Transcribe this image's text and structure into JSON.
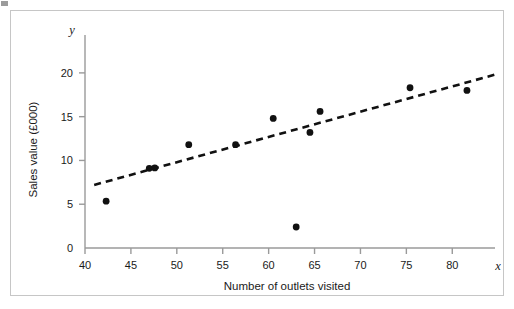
{
  "figure": {
    "caption_fragment": "",
    "border_color": "#c6c6c6",
    "background": "#ffffff"
  },
  "chart_data": {
    "type": "scatter",
    "title": "",
    "subtitle": "",
    "xlabel": "Number of outlets visited",
    "ylabel": "Sales value (£000)",
    "x_axis_letter": "x",
    "y_axis_letter": "y",
    "xlim": [
      40,
      84
    ],
    "ylim": [
      0,
      22.5
    ],
    "xticks": [
      40,
      45,
      50,
      55,
      60,
      65,
      70,
      75,
      80
    ],
    "xtick_labels": [
      "40",
      "45",
      "50",
      "55",
      "60",
      "65",
      "70",
      "75",
      "80"
    ],
    "yticks": [
      0,
      5,
      10,
      15,
      20
    ],
    "ytick_labels": [
      "0",
      "5",
      "10",
      "15",
      "20"
    ],
    "grid": false,
    "legend": false,
    "marker_color": "#111111",
    "axis_color": "#9a9a9a",
    "series": [
      {
        "name": "Outlets visited vs sales value",
        "marker": "filled-circle",
        "points": [
          {
            "x": 42.3,
            "y": 5.35
          },
          {
            "x": 47.0,
            "y": 9.1
          },
          {
            "x": 47.6,
            "y": 9.15
          },
          {
            "x": 51.3,
            "y": 11.8
          },
          {
            "x": 56.4,
            "y": 11.8
          },
          {
            "x": 60.5,
            "y": 14.8
          },
          {
            "x": 63.0,
            "y": 2.4
          },
          {
            "x": 64.5,
            "y": 13.2
          },
          {
            "x": 65.6,
            "y": 15.6
          },
          {
            "x": 75.4,
            "y": 18.3
          },
          {
            "x": 81.6,
            "y": 18.0
          }
        ]
      }
    ],
    "trendline": {
      "name": "line of best fit",
      "style": "dashed",
      "color": "#111111",
      "x_start": 41.0,
      "y_start": 7.2,
      "x_end": 85.0,
      "y_end": 19.9
    },
    "annotations": []
  }
}
